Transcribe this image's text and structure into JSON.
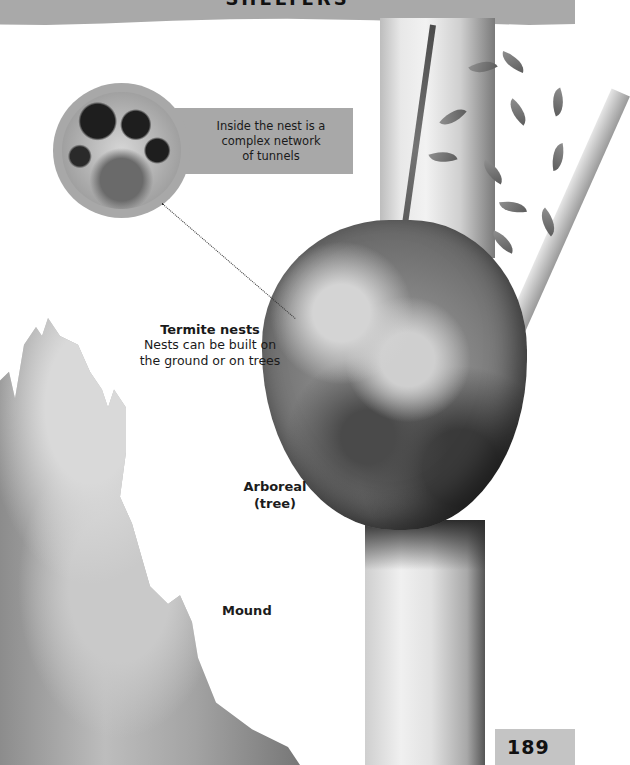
{
  "header": {
    "title": "SHELTERS",
    "band_color": "#a9a9a9"
  },
  "callout": {
    "text_lines": [
      "Inside the nest is a",
      "complex network",
      "of tunnels"
    ],
    "box_color": "#a8a8a8",
    "image": "termite-tunnels-photo"
  },
  "labels": {
    "termite_nests": {
      "title": "Termite nests",
      "lines": [
        "Nests can be built on",
        "the ground or on trees"
      ]
    },
    "arboreal": {
      "lines": [
        "Arboreal",
        "(tree)"
      ]
    },
    "mound": "Mound"
  },
  "illustrations": {
    "arboreal_nest": "arboreal-termite-nest-on-tree",
    "mound_nest": "termite-mound",
    "tree": "tree-trunk-with-vine"
  },
  "page": {
    "number": "189",
    "box_color": "#c4c4c4"
  }
}
